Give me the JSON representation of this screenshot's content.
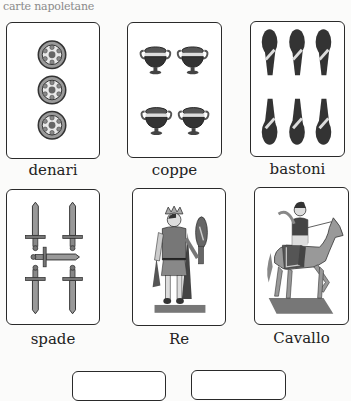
{
  "caption": "carte napoletane",
  "cards": [
    {
      "id": "denari",
      "label": "denari",
      "icon": "coin-icon",
      "count": 3
    },
    {
      "id": "coppe",
      "label": "coppe",
      "icon": "cup-icon",
      "count": 4
    },
    {
      "id": "bastoni",
      "label": "bastoni",
      "icon": "club-icon",
      "count": 6
    },
    {
      "id": "spade",
      "label": "spade",
      "icon": "sword-icon",
      "count": 5
    },
    {
      "id": "re",
      "label": "Re",
      "icon": "king-figure-icon",
      "count": 1
    },
    {
      "id": "cavallo",
      "label": "Cavallo",
      "icon": "horseman-figure-icon",
      "count": 1
    }
  ],
  "colors": {
    "card_border": "#2a2a2a",
    "ink_dark": "#333333",
    "ink_mid": "#7a7a7a",
    "ink_light": "#bdbdbd"
  }
}
